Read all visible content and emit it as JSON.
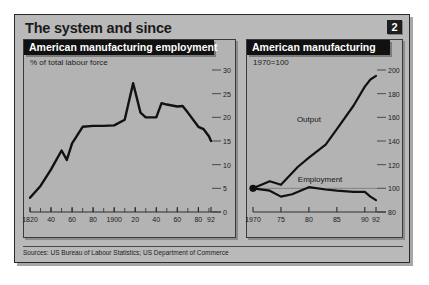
{
  "figure": {
    "headline": "The system and since",
    "badge": "2",
    "sources": "Sources: US Bureau of Labour Statistics; US Department of Commerce",
    "colors": {
      "frame_background": "#b9b9b9",
      "panel_background": "#b3b3b3",
      "panel_title_background": "#111111",
      "panel_title_text": "#ffffff",
      "line": "#111111",
      "headline_text": "#1b1b1b"
    }
  },
  "chart_data": [
    {
      "type": "line",
      "id": "american-manufacturing-employment",
      "title": "American manufacturing employment",
      "subtitle": "% of total labour force",
      "xlabel": "",
      "ylabel": "",
      "xlim": [
        1820,
        1992
      ],
      "ylim": [
        0,
        30
      ],
      "yticks": [
        0,
        5,
        10,
        15,
        20,
        25,
        30
      ],
      "xticks": [
        1820,
        1840,
        1860,
        1880,
        1900,
        1920,
        1940,
        1960,
        1980,
        1992
      ],
      "xticklabels": [
        "1820",
        "40",
        "60",
        "80",
        "1900",
        "20",
        "40",
        "60",
        "80",
        "92"
      ],
      "minor_xticks_every": 10,
      "grid": false,
      "legend": "none",
      "series": [
        {
          "name": "Manufacturing employment",
          "x": [
            1820,
            1830,
            1840,
            1850,
            1855,
            1860,
            1870,
            1880,
            1890,
            1900,
            1910,
            1918,
            1925,
            1930,
            1940,
            1945,
            1950,
            1955,
            1960,
            1965,
            1970,
            1980,
            1985,
            1990,
            1992
          ],
          "values": [
            3.0,
            5.5,
            9.0,
            13.0,
            11.0,
            14.5,
            18.0,
            18.2,
            18.2,
            18.3,
            19.5,
            27.2,
            21.0,
            20.0,
            20.0,
            23.0,
            22.7,
            22.5,
            22.3,
            22.4,
            21.0,
            18.0,
            17.5,
            16.0,
            15.0
          ]
        }
      ]
    },
    {
      "type": "line",
      "id": "american-manufacturing",
      "title": "American manufacturing",
      "subtitle": "1970=100",
      "xlabel": "",
      "ylabel": "",
      "xlim": [
        1970,
        1992
      ],
      "ylim": [
        80,
        200
      ],
      "yticks": [
        80,
        100,
        120,
        140,
        160,
        180,
        200
      ],
      "xticks": [
        1970,
        1975,
        1980,
        1985,
        1990,
        1992
      ],
      "xticklabels": [
        "1970",
        "75",
        "80",
        "85",
        "90",
        "92"
      ],
      "grid": false,
      "legend": "inline-labels",
      "origin_marker": {
        "x": 1970,
        "y": 100,
        "style": "filled-dot"
      },
      "series": [
        {
          "name": "Output",
          "label_x": 1980,
          "label_y": 158,
          "x": [
            1970,
            1973,
            1975,
            1978,
            1980,
            1983,
            1985,
            1988,
            1990,
            1991,
            1992
          ],
          "values": [
            100,
            106,
            103,
            118,
            126,
            137,
            150,
            170,
            186,
            192,
            195
          ]
        },
        {
          "name": "Employment",
          "label_x": 1982,
          "label_y": 107,
          "x": [
            1970,
            1973,
            1975,
            1977,
            1980,
            1983,
            1985,
            1988,
            1990,
            1991,
            1992
          ],
          "values": [
            100,
            98,
            93,
            95,
            101,
            99,
            98,
            97,
            97,
            93,
            90
          ]
        }
      ]
    }
  ]
}
